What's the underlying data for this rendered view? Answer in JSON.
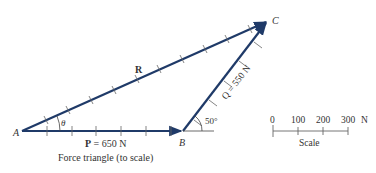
{
  "diagram": {
    "caption": "Force triangle (to scale)",
    "points": {
      "A": "A",
      "B": "B",
      "C": "C"
    },
    "vectors": {
      "P": {
        "symbol": "P",
        "label": " = 650 N"
      },
      "Q": {
        "label": "Q = 550 N"
      },
      "R": {
        "label": "R"
      }
    },
    "angles": {
      "theta": "θ",
      "beta": "50°"
    },
    "scale": {
      "title": "Scale",
      "ticks": [
        "0",
        "100",
        "200",
        "300"
      ],
      "unit": "N"
    },
    "colors": {
      "vector": "#1f3a68",
      "text": "#333333",
      "tick": "#555555"
    }
  }
}
